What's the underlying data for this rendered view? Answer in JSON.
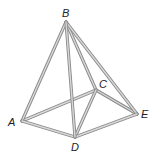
{
  "diagram": {
    "type": "pyramid-wireframe",
    "vertices": [
      {
        "name": "B",
        "x": 66,
        "y": 22,
        "label_x": 62,
        "label_y": 17
      },
      {
        "name": "A",
        "x": 22,
        "y": 121,
        "label_x": 8,
        "label_y": 126
      },
      {
        "name": "C",
        "x": 96,
        "y": 90,
        "label_x": 99,
        "label_y": 88
      },
      {
        "name": "D",
        "x": 75,
        "y": 137,
        "label_x": 71,
        "label_y": 151
      },
      {
        "name": "E",
        "x": 137,
        "y": 114,
        "label_x": 141,
        "label_y": 118
      }
    ],
    "edges": [
      [
        "B",
        "A"
      ],
      [
        "B",
        "D"
      ],
      [
        "B",
        "C"
      ],
      [
        "B",
        "E"
      ],
      [
        "A",
        "D"
      ],
      [
        "A",
        "C"
      ],
      [
        "D",
        "E"
      ],
      [
        "C",
        "E"
      ],
      [
        "C",
        "D"
      ]
    ],
    "labels": {
      "A": "A",
      "B": "B",
      "C": "C",
      "D": "D",
      "E": "E"
    }
  }
}
